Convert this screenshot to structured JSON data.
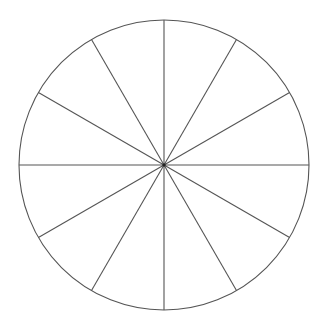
{
  "diagram": {
    "type": "segmented-circle",
    "segments": 12,
    "segment_angle_deg": 30,
    "center": {
      "x": 164,
      "y": 165
    },
    "radius": 145,
    "stroke_color": "#555555",
    "stroke_width": 1.1,
    "background": "#ffffff",
    "center_dot_color": "#222222",
    "labels": []
  }
}
